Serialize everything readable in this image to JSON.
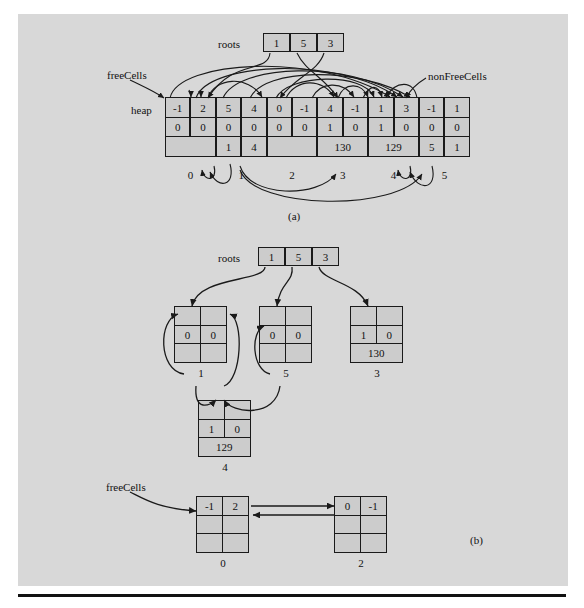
{
  "figure": {
    "caption_a": "(a)",
    "caption_b": "(b)"
  },
  "part_a": {
    "labels": {
      "roots": "roots",
      "heap": "heap",
      "free_cells": "freeCells",
      "non_free_cells": "nonFreeCells"
    },
    "roots_values": [
      "1",
      "5",
      "3"
    ],
    "heap_row1": [
      "-1",
      "2",
      "5",
      "4",
      "0",
      "-1",
      "4",
      "-1",
      "1",
      "3",
      "-1",
      "1"
    ],
    "heap_row2": [
      "0",
      "0",
      "0",
      "0",
      "0",
      "0",
      "1",
      "0",
      "1",
      "0",
      "0",
      "0"
    ],
    "heap_row3": [
      "",
      "1",
      "4",
      "",
      "130",
      "129",
      "5",
      "1"
    ],
    "index_labels": [
      "0",
      "1",
      "2",
      "3",
      "4",
      "5"
    ]
  },
  "part_b": {
    "labels": {
      "roots": "roots",
      "free_cells": "freeCells"
    },
    "roots_values": [
      "1",
      "5",
      "3"
    ],
    "nodes": [
      {
        "id": "node-1",
        "index_label": "1",
        "top": [
          "",
          ""
        ],
        "mid": [
          "0",
          "0"
        ],
        "bottom": ""
      },
      {
        "id": "node-5",
        "index_label": "5",
        "top": [
          "",
          ""
        ],
        "mid": [
          "0",
          "0"
        ],
        "bottom": ""
      },
      {
        "id": "node-3",
        "index_label": "3",
        "top": [
          "",
          ""
        ],
        "mid": [
          "1",
          "0"
        ],
        "bottom": "130"
      },
      {
        "id": "node-4",
        "index_label": "4",
        "top": [
          "",
          ""
        ],
        "mid": [
          "1",
          "0"
        ],
        "bottom": "129"
      },
      {
        "id": "node-0",
        "index_label": "0",
        "top": [
          "-1",
          "2"
        ],
        "mid": [
          "",
          ""
        ],
        "bottom": ""
      },
      {
        "id": "node-2",
        "index_label": "2",
        "top": [
          "0",
          "-1"
        ],
        "mid": [
          "",
          ""
        ],
        "bottom": ""
      }
    ]
  },
  "colors": {
    "panel_background": "#d8d8d8",
    "cell_fill": "#cccccc",
    "stroke": "#1a1a1a",
    "page_background": "#ffffff"
  }
}
